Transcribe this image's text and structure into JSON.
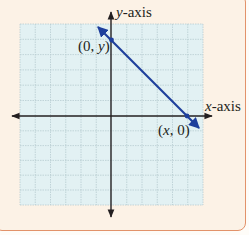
{
  "figure": {
    "type": "coordinate-plane",
    "background_color": "#fcf2e6",
    "border_color": "#e2926a",
    "grid": {
      "background_color": "#e2f1f3",
      "line_color": "#b7cdd0",
      "columns": 12,
      "rows": 12,
      "x_range": [
        -6,
        6
      ],
      "y_range": [
        -6,
        6
      ]
    },
    "axes": {
      "color": "#231f20",
      "x_axis_label": {
        "var": "x",
        "suffix": "-axis"
      },
      "y_axis_label": {
        "var": "y",
        "suffix": "-axis"
      }
    },
    "line": {
      "color": "#1e3f9c",
      "equation_hint": "y = -x + 5",
      "arrows_both_ends": true
    },
    "points": [
      {
        "name": "y-intercept",
        "coords": [
          0,
          5
        ],
        "label_open": "(0, ",
        "label_var": "y",
        "label_close": ")"
      },
      {
        "name": "x-intercept",
        "coords": [
          5,
          0
        ],
        "label_open": "(",
        "label_var": "x",
        "label_close": ", 0)"
      }
    ]
  }
}
